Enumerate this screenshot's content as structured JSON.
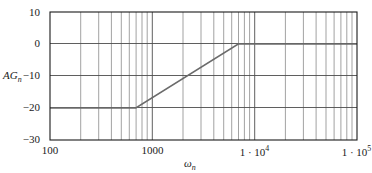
{
  "chart_data": {
    "type": "line",
    "title": "",
    "subtitle": "",
    "xlabel": "ωn",
    "ylabel": "AGn",
    "xscale": "log",
    "yscale": "linear",
    "xlim": [
      100,
      100000
    ],
    "ylim": [
      -30,
      10
    ],
    "grid": true,
    "grid_minor": true,
    "legend": "none",
    "xticks": [
      {
        "value": 100,
        "label": "100"
      },
      {
        "value": 1000,
        "label": "1000"
      },
      {
        "value": 10000,
        "label": "1 · 10",
        "exponent": "4"
      },
      {
        "value": 100000,
        "label": "1 · 10",
        "exponent": "5"
      }
    ],
    "yticks": [
      {
        "value": 10,
        "label": "10"
      },
      {
        "value": 0,
        "label": "0"
      },
      {
        "value": -10,
        "label": "−10"
      },
      {
        "value": -20,
        "label": "−20"
      },
      {
        "value": -30,
        "label": "−30"
      }
    ],
    "series": [
      {
        "name": "AG_n asymptotic gain",
        "color": "#6b6b6b",
        "linewidth": 1.6,
        "points": [
          {
            "x": 100,
            "y": -20
          },
          {
            "x": 690,
            "y": -20
          },
          {
            "x": 6900,
            "y": 0
          },
          {
            "x": 100000,
            "y": 0
          }
        ]
      }
    ],
    "breakpoints": [
      {
        "x": 690,
        "y": -20,
        "note": "low corner frequency"
      },
      {
        "x": 6900,
        "y": 0,
        "note": "high corner frequency"
      }
    ],
    "slope_db_per_decade": 20,
    "annotations": []
  },
  "figure": {
    "ylabel_main": "AG",
    "ylabel_sub": "n",
    "xlabel_main": "ω",
    "xlabel_sub": "n",
    "caption": ""
  },
  "colors": {
    "curve": "#6b6b6b",
    "frame": "#1a1a1a",
    "gridline_major": "#4d4d4d",
    "gridline_minor": "#7a7a7a",
    "background": "#ffffff",
    "text": "#1a1a1a"
  }
}
